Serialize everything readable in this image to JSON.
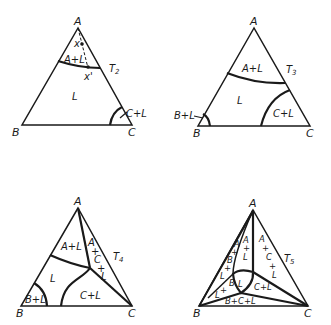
{
  "diagrams": [
    {
      "temperature": "T2",
      "temperature_sub": "2",
      "vertices": {
        "top": "A",
        "left": "B",
        "right": "C"
      },
      "regions": [
        "A+L",
        "L",
        "C+L"
      ],
      "points": [
        "x",
        "x'"
      ]
    },
    {
      "temperature": "T3",
      "temperature_sub": "3",
      "vertices": {
        "top": "A",
        "left": "B",
        "right": "C"
      },
      "regions": [
        "A+L",
        "L",
        "C+L",
        "B+L"
      ]
    },
    {
      "temperature": "T4",
      "temperature_sub": "4",
      "vertices": {
        "top": "A",
        "left": "B",
        "right": "C"
      },
      "regions": [
        "A+L",
        "L",
        "C+L",
        "B+L",
        "A+C+L"
      ]
    },
    {
      "temperature": "T5",
      "temperature_sub": "5",
      "vertices": {
        "top": "A",
        "left": "B",
        "right": "C"
      },
      "regions": [
        "A+L",
        "L",
        "C+L",
        "B+L",
        "A+C+L",
        "A+B+L",
        "B+C+L"
      ]
    }
  ],
  "labels": {
    "A": "A",
    "B": "B",
    "C": "C",
    "T": "T",
    "L": "L",
    "AL": "A+L",
    "CL": "C+L",
    "BL": "B+L",
    "x": "x",
    "xp": "x'",
    "A_": "A",
    "plus": "+",
    "C_": "C",
    "B_": "B",
    "BCL": "B+C+L",
    "BplusL": "+L"
  }
}
